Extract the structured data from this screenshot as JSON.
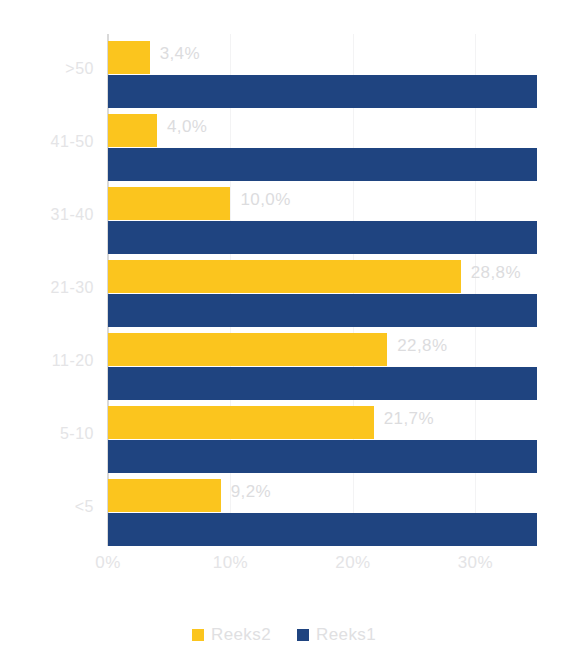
{
  "chart_data": {
    "type": "bar",
    "orientation": "horizontal",
    "title": "",
    "subtitle": "",
    "xlabel": "",
    "ylabel": "",
    "categories": [
      ">50",
      "41-50",
      "31-40",
      "21-30",
      "11-20",
      "5-10",
      "<5"
    ],
    "series": [
      {
        "name": "Reeks2",
        "color": "#fbc51e",
        "values": [
          3.4,
          4.0,
          10.0,
          28.8,
          22.8,
          21.7,
          9.2
        ],
        "labels": [
          "3,4%",
          "4,0%",
          "10,0%",
          "28,8%",
          "22,8%",
          "21,7%",
          "9,2%"
        ]
      },
      {
        "name": "Reeks1",
        "color": "#1f4480",
        "values": [
          35.0,
          35.0,
          35.0,
          35.0,
          35.0,
          35.0,
          35.0
        ],
        "labels": [
          "",
          "",
          "",
          "",
          "",
          "",
          ""
        ]
      }
    ],
    "xlim": [
      0,
      35.6
    ],
    "x_ticks": [
      0,
      10,
      20,
      30
    ],
    "x_tick_labels": [
      "0%",
      "10%",
      "20%",
      "30%"
    ],
    "grid": true,
    "grid_axis": "x",
    "legend_position": "bottom",
    "label_color": "#dcdcde",
    "tick_color": "#e4e4e6",
    "axis_line_color": "#d9d9d9",
    "background": "#ffffff"
  },
  "legend": {
    "items": [
      {
        "label": "Reeks2",
        "color": "#fbc51e",
        "swatch_name": "legend-swatch-reeks2"
      },
      {
        "label": "Reeks1",
        "color": "#1f4480",
        "swatch_name": "legend-swatch-reeks1"
      }
    ]
  }
}
